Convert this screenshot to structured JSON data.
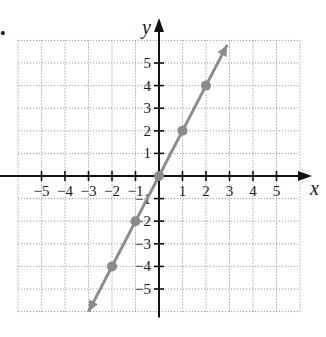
{
  "chart_data": {
    "type": "line",
    "title": "",
    "xlabel": "x",
    "ylabel": "y",
    "xlim": [
      -6,
      6
    ],
    "ylim": [
      -6,
      6
    ],
    "grid": true,
    "grid_style": "dotted",
    "x_ticks": [
      -5,
      -4,
      -3,
      -2,
      -1,
      1,
      2,
      3,
      4,
      5
    ],
    "y_ticks": [
      -5,
      -4,
      -3,
      -2,
      -1,
      1,
      2,
      3,
      4,
      5
    ],
    "x_tick_labels": [
      "−5",
      "−4",
      "−3",
      "−2",
      "−1",
      "1",
      "2",
      "3",
      "4",
      "5"
    ],
    "y_tick_labels": [
      "−5",
      "−4",
      "−3",
      "−2",
      "−1",
      "1",
      "2",
      "3",
      "4",
      "5"
    ],
    "series": [
      {
        "name": "y = 2x",
        "equation": "y = 2x",
        "line_from": [
          -3,
          -6
        ],
        "line_to": [
          2.9,
          5.8
        ],
        "arrows_both_ends": true,
        "points": [
          [
            -2,
            -4
          ],
          [
            -1,
            -2
          ],
          [
            0,
            0
          ],
          [
            1,
            2
          ],
          [
            2,
            4
          ]
        ],
        "color": "#8c8c8c"
      }
    ]
  },
  "labels": {
    "x_axis": "x",
    "y_axis": "y",
    "bullet": "•"
  },
  "colors": {
    "axis": "#111111",
    "grid": "#9a9a9a",
    "line": "#8c8c8c",
    "point": "#8a8a8a"
  }
}
